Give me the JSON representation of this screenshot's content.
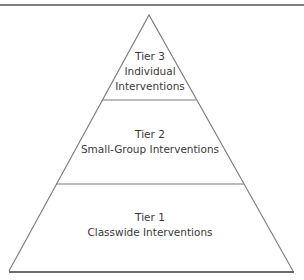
{
  "diagram": {
    "type": "pyramid",
    "tiers": [
      {
        "level": 3,
        "lines": [
          "Tier 3",
          "Individual",
          "Interventions"
        ]
      },
      {
        "level": 2,
        "lines": [
          "Tier 2",
          "Small-Group Interventions"
        ]
      },
      {
        "level": 1,
        "lines": [
          "Tier 1",
          "Classwide Interventions"
        ]
      }
    ],
    "colors": {
      "line": "#7a7a7a",
      "text": "#3a3a3a",
      "background": "#ffffff"
    }
  }
}
